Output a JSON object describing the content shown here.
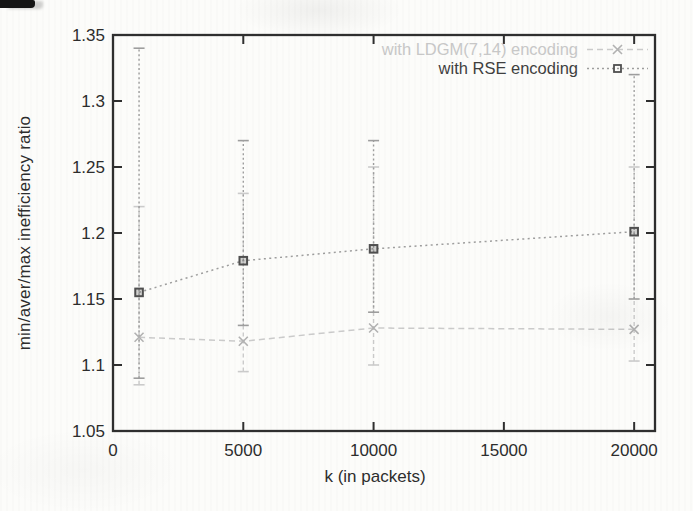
{
  "chart_data": {
    "type": "line",
    "title": "",
    "xlabel": "k (in packets)",
    "ylabel": "min/aver/max inefficiency ratio",
    "grid": false,
    "legend_position": "top-right inside plot",
    "xlim": [
      0,
      20800
    ],
    "ylim": [
      1.05,
      1.35
    ],
    "x": [
      1000,
      5000,
      10000,
      20000
    ],
    "x_ticks": [
      {
        "value": 0,
        "label": "0"
      },
      {
        "value": 5000,
        "label": "5000"
      },
      {
        "value": 10000,
        "label": "10000"
      },
      {
        "value": 15000,
        "label": "15000"
      },
      {
        "value": 20000,
        "label": "20000"
      }
    ],
    "y_ticks": [
      {
        "value": 1.05,
        "label": "1.05"
      },
      {
        "value": 1.1,
        "label": "1.1"
      },
      {
        "value": 1.15,
        "label": "1.15"
      },
      {
        "value": 1.2,
        "label": "1.2"
      },
      {
        "value": 1.25,
        "label": "1.25"
      },
      {
        "value": 1.3,
        "label": "1.3"
      },
      {
        "value": 1.35,
        "label": "1.35"
      }
    ],
    "series": [
      {
        "name": "with LDGM(7,14) encoding",
        "marker": "x",
        "errorbars": "min-max",
        "line_color": "#cbcbcb",
        "marker_color": "#b2b2b2",
        "label_color": "#c8c8c8",
        "avg": [
          1.121,
          1.118,
          1.128,
          1.127
        ],
        "min": [
          1.085,
          1.095,
          1.1,
          1.103
        ],
        "max": [
          1.22,
          1.23,
          1.25,
          1.25
        ]
      },
      {
        "name": "with RSE encoding",
        "marker": "square",
        "errorbars": "min-max",
        "line_color": "#9e9e9e",
        "marker_color": "#4f4f4f",
        "label_color": "#3f3f3f",
        "avg": [
          1.155,
          1.179,
          1.188,
          1.201
        ],
        "min": [
          1.09,
          1.13,
          1.14,
          1.15
        ],
        "max": [
          1.34,
          1.27,
          1.27,
          1.32
        ]
      }
    ]
  },
  "colors": {
    "frame": "#2f2f2f",
    "tick_text": "#2d2d2d",
    "background": "#fcfcfa"
  }
}
